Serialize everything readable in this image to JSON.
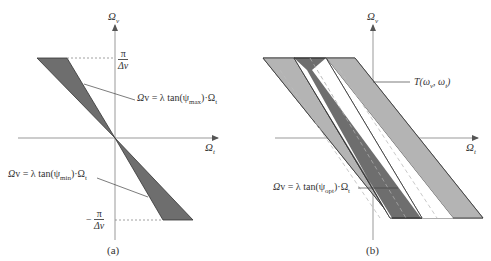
{
  "figure": {
    "panel_a": {
      "caption": "(a)",
      "axis_v_label": "Ω",
      "axis_v_sub": "v",
      "axis_h_label": "Ω",
      "axis_h_sub": "t",
      "tick_top_num": "π",
      "tick_top_den": "Δv",
      "tick_bottom_sign": "−",
      "tick_bottom_num": "π",
      "tick_bottom_den": "Δv",
      "eq_max": "Ω",
      "eq_max_text": "v = λ tan(ψ",
      "eq_max_sub": "max",
      "eq_max_tail": ")·Ω",
      "eq_max_tail_sub": "t",
      "eq_min": "Ω",
      "eq_min_text": "v = λ tan(ψ",
      "eq_min_sub": "min",
      "eq_min_tail": ")·Ω",
      "eq_min_tail_sub": "t"
    },
    "panel_b": {
      "caption": "(b)",
      "axis_v_label": "Ω",
      "axis_v_sub": "v",
      "axis_h_label": "Ω",
      "axis_h_sub": "t",
      "region_label": "T(ω",
      "region_label_sub1": "v",
      "region_label_mid": ", ω",
      "region_label_sub2": "t",
      "region_label_end": ")",
      "eq_opt": "Ω",
      "eq_opt_text": "v = λ tan(ψ",
      "eq_opt_sub": "opt",
      "eq_opt_tail": ")·Ω",
      "eq_opt_tail_sub": "t"
    },
    "colors": {
      "dark_fill": "#6e6e6e",
      "light_fill": "#b4b4b4",
      "axis": "#888888",
      "edge": "#333333"
    }
  }
}
